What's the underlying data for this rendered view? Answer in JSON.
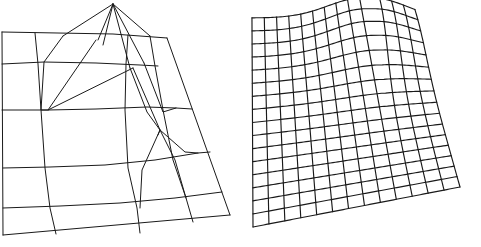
{
  "figure": {
    "title": "",
    "caption": "",
    "background_color": "#ffffff",
    "line_color": "#1a1a1a",
    "panel_count": 2
  },
  "chart_data": [
    {
      "type": "line",
      "id": "coarse-adaptive-mesh",
      "title": "",
      "subtitle": "",
      "xlabel": "",
      "ylabel": "",
      "grid": false,
      "legend_position": "none",
      "description": "Coarse adaptive quadrilateral surface wireframe in oblique projection with a tall narrow spike near the top centre",
      "projection": "oblique-perspective",
      "style": "wireframe-hidden-lines-shown",
      "outline": [
        [
          2,
          32
        ],
        [
          167,
          38
        ],
        [
          230,
          215
        ],
        [
          3,
          235
        ]
      ],
      "peak_apex": [
        113,
        4
      ],
      "polylines": [
        {
          "name": "outline-top",
          "points": [
            [
              2,
              32
            ],
            [
              113,
              34
            ],
            [
              167,
              38
            ]
          ]
        },
        {
          "name": "outline-right",
          "points": [
            [
              167,
              38
            ],
            [
              230,
              215
            ]
          ]
        },
        {
          "name": "outline-bottom",
          "points": [
            [
              230,
              215
            ],
            [
              3,
              235
            ]
          ]
        },
        {
          "name": "outline-left",
          "points": [
            [
              3,
              235
            ],
            [
              2,
              32
            ]
          ]
        },
        {
          "name": "row-1",
          "points": [
            [
              2,
              64
            ],
            [
              44,
              62
            ],
            [
              96,
              63
            ],
            [
              140,
              65
            ],
            [
              158,
              66
            ]
          ]
        },
        {
          "name": "row-2",
          "points": [
            [
              2,
              110
            ],
            [
              48,
              110
            ],
            [
              96,
              109
            ],
            [
              147,
              107
            ],
            [
              176,
              108
            ],
            [
              192,
              109
            ]
          ]
        },
        {
          "name": "row-3",
          "points": [
            [
              3,
              168
            ],
            [
              50,
              167
            ],
            [
              105,
              165
            ],
            [
              155,
              160
            ],
            [
              198,
              153
            ],
            [
              210,
              152
            ]
          ]
        },
        {
          "name": "row-4",
          "points": [
            [
              3,
              208
            ],
            [
              60,
              206
            ],
            [
              120,
              203
            ],
            [
              175,
              198
            ],
            [
              222,
              192
            ]
          ]
        },
        {
          "name": "col-1",
          "points": [
            [
              35,
              33
            ],
            [
              38,
              64
            ],
            [
              41,
              110
            ],
            [
              45,
              168
            ],
            [
              50,
              208
            ],
            [
              56,
              234
            ]
          ]
        },
        {
          "name": "col-2",
          "points": [
            [
              128,
              35
            ],
            [
              126,
              64
            ],
            [
              125,
              110
            ],
            [
              128,
              168
            ],
            [
              137,
              208
            ],
            [
              140,
              233
            ]
          ]
        },
        {
          "name": "col-3",
          "points": [
            [
              150,
              36
            ],
            [
              155,
              66
            ],
            [
              163,
              110
            ],
            [
              173,
              160
            ],
            [
              186,
              198
            ],
            [
              193,
              222
            ]
          ]
        },
        {
          "name": "ridge-a",
          "points": [
            [
              113,
              4
            ],
            [
              63,
              36
            ]
          ]
        },
        {
          "name": "ridge-b",
          "points": [
            [
              113,
              4
            ],
            [
              98,
              40
            ]
          ]
        },
        {
          "name": "ridge-c",
          "points": [
            [
              113,
              4
            ],
            [
              103,
              45
            ]
          ]
        },
        {
          "name": "ridge-d",
          "points": [
            [
              113,
              4
            ],
            [
              130,
              68
            ]
          ]
        },
        {
          "name": "ridge-e",
          "points": [
            [
              113,
              4
            ],
            [
              144,
              63
            ]
          ]
        },
        {
          "name": "ridge-f",
          "points": [
            [
              113,
              4
            ],
            [
              150,
              36
            ]
          ]
        },
        {
          "name": "fold-1",
          "points": [
            [
              63,
              36
            ],
            [
              44,
              62
            ],
            [
              41,
              110
            ],
            [
              48,
              110
            ]
          ]
        },
        {
          "name": "fold-2",
          "points": [
            [
              96,
              40
            ],
            [
              48,
              110
            ],
            [
              133,
              68
            ]
          ]
        },
        {
          "name": "fold-3",
          "points": [
            [
              133,
              68
            ],
            [
              160,
              130
            ],
            [
              158,
              135
            ]
          ]
        },
        {
          "name": "fold-4",
          "points": [
            [
              130,
              68
            ],
            [
              147,
              112
            ],
            [
              160,
              130
            ]
          ]
        },
        {
          "name": "fold-5",
          "points": [
            [
              160,
              130
            ],
            [
              185,
              152
            ],
            [
              198,
              153
            ]
          ]
        },
        {
          "name": "fold-6",
          "points": [
            [
              160,
              130
            ],
            [
              142,
              170
            ],
            [
              140,
              208
            ]
          ]
        },
        {
          "name": "fold-7",
          "points": [
            [
              160,
              130
            ],
            [
              175,
              160
            ],
            [
              186,
              198
            ]
          ]
        },
        {
          "name": "fold-8",
          "points": [
            [
              144,
              63
            ],
            [
              163,
              112
            ],
            [
              176,
              108
            ]
          ]
        }
      ]
    },
    {
      "type": "line",
      "id": "fine-regular-mesh",
      "title": "",
      "subtitle": "",
      "xlabel": "",
      "ylabel": "",
      "grid": true,
      "legend_position": "none",
      "description": "Fine regular quadrilateral surface wireframe in oblique projection, uniformly subdivided and warped upward at the top-right, resolving the spike of the coarse mesh",
      "projection": "oblique-perspective",
      "style": "wireframe-hidden-lines-shown",
      "rows": 16,
      "columns": 13,
      "corners": {
        "top_left": [
          12,
          18
        ],
        "top_right": [
          173,
          20
        ],
        "bottom_right": [
          220,
          187
        ],
        "bottom_left": [
          13,
          227
        ]
      },
      "warp": {
        "center_u": 0.72,
        "center_v": 0.04,
        "amplitude_px": 22,
        "falloff": 0.33
      }
    }
  ]
}
